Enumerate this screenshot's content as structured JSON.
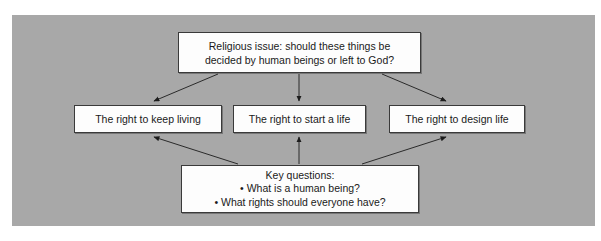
{
  "diagram": {
    "type": "flow-diagram",
    "background_color": "#a8a8a8",
    "node_fill_color": "#fdfdfd",
    "node_border_color": "#3a3a3a",
    "text_color": "#1a1a1a",
    "nodes": {
      "top": {
        "id": "religious-issue",
        "text": "Religious issue: should these things be\ndecided by human beings or left to God?"
      },
      "left": {
        "id": "right-to-keep-living",
        "text": "The right to keep living"
      },
      "middle": {
        "id": "right-to-start-a-life",
        "text": "The right to start a life"
      },
      "right": {
        "id": "right-to-design-life",
        "text": "The right to design life"
      },
      "bottom": {
        "id": "key-questions",
        "text": "Key questions:\n• What is a human being?\n• What rights should everyone have?"
      }
    },
    "connections": [
      {
        "from": "religious-issue",
        "to": "right-to-keep-living",
        "style": "arrow"
      },
      {
        "from": "religious-issue",
        "to": "right-to-start-a-life",
        "style": "arrow"
      },
      {
        "from": "religious-issue",
        "to": "right-to-design-life",
        "style": "arrow"
      },
      {
        "from": "key-questions",
        "to": "right-to-keep-living",
        "style": "arrow"
      },
      {
        "from": "key-questions",
        "to": "right-to-start-a-life",
        "style": "arrow"
      },
      {
        "from": "key-questions",
        "to": "right-to-design-life",
        "style": "arrow"
      }
    ]
  }
}
